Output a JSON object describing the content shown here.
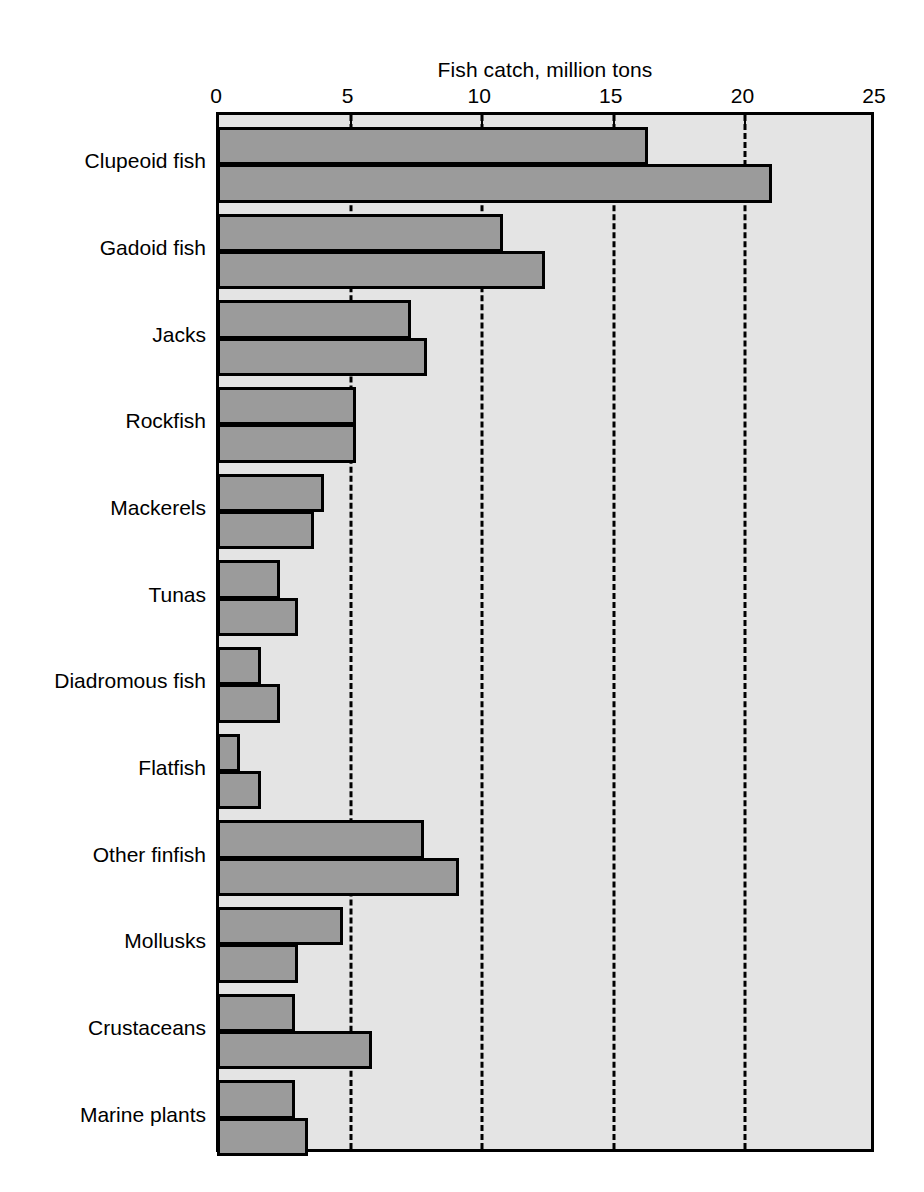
{
  "chart_data": {
    "type": "bar",
    "orientation": "horizontal",
    "title": "Fish catch, million tons",
    "xlabel": "",
    "ylabel": "",
    "xlim": [
      0,
      25
    ],
    "xticks": [
      0,
      5,
      10,
      15,
      20,
      25
    ],
    "xtick_labels": [
      "0",
      "5",
      "10",
      "15",
      "20",
      "25"
    ],
    "grid": "vertical dashed gridlines at 5, 10, 15, 20",
    "gridlines": [
      5,
      10,
      15,
      20
    ],
    "legend": "none",
    "categories": [
      "Clupeoid fish",
      "Gadoid fish",
      "Jacks",
      "Rockfish",
      "Mackerels",
      "Tunas",
      "Diadromous fish",
      "Flatfish",
      "Other finfish",
      "Mollusks",
      "Crustaceans",
      "Marine plants"
    ],
    "series": [
      {
        "name": "first bar",
        "values": [
          16.3,
          10.8,
          7.3,
          5.2,
          4.0,
          2.3,
          1.6,
          0.8,
          7.8,
          4.7,
          2.9,
          2.9
        ]
      },
      {
        "name": "second bar",
        "values": [
          21.0,
          12.4,
          7.9,
          5.2,
          3.6,
          3.0,
          2.3,
          1.6,
          9.1,
          3.0,
          5.8,
          3.4
        ]
      }
    ],
    "colors": {
      "bar_fill": "#9b9b9b",
      "bar_edge": "#000000",
      "plot_background": "#e4e4e4",
      "gridline": "#000000",
      "page_background": "#ffffff",
      "text": "#000000"
    }
  }
}
